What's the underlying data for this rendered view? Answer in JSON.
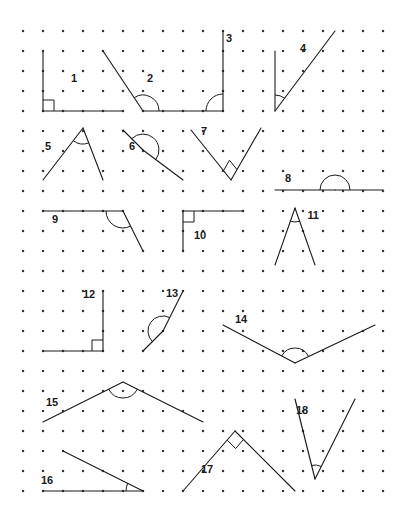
{
  "worksheet": {
    "title": "Angle Identification Dot-Grid Worksheet",
    "width": 395,
    "height": 520,
    "background_color": "#ffffff",
    "stroke_color": "#1a1a1a",
    "dot_color": "#3a3a3a"
  },
  "grid": {
    "type": "dot-lattice",
    "origin_x": 23,
    "origin_y": 31,
    "spacing": 20,
    "columns": 19,
    "rows": 24,
    "dot_radius": 1.1
  },
  "figures": [
    {
      "id": 1,
      "label": "1",
      "label_x": 74,
      "label_y": 78,
      "vertex": [
        43,
        111
      ],
      "rays": [
        [
          43,
          51
        ],
        [
          123,
          111
        ]
      ],
      "marker": "square",
      "marker_size": 11,
      "angle_degrees": 90,
      "classification": "right"
    },
    {
      "id": 2,
      "label": "2",
      "label_x": 150,
      "label_y": 78,
      "vertex": [
        143,
        111
      ],
      "rays": [
        [
          103,
          51
        ],
        [
          203,
          111
        ]
      ],
      "marker": "arc",
      "marker_radius": 16,
      "angle_degrees": 112,
      "classification": "obtuse"
    },
    {
      "id": 3,
      "label": "3",
      "label_x": 229,
      "label_y": 38,
      "vertex": [
        223,
        111
      ],
      "rays": [
        [
          223,
          31
        ],
        [
          203,
          111
        ]
      ],
      "marker": "arc",
      "marker_radius": 17,
      "angle_degrees": 180,
      "classification": "straight"
    },
    {
      "id": 4,
      "label": "4",
      "label_x": 303,
      "label_y": 48,
      "vertex": [
        275,
        111
      ],
      "rays": [
        [
          275,
          51
        ],
        [
          335,
          31
        ]
      ],
      "marker": "arc",
      "marker_radius": 16,
      "angle_degrees": 37,
      "classification": "acute"
    },
    {
      "id": 5,
      "label": "5",
      "label_x": 48,
      "label_y": 146,
      "vertex": [
        83,
        128
      ],
      "rays": [
        [
          43,
          180
        ],
        [
          103,
          180
        ]
      ],
      "marker": "arc",
      "marker_radius": 16,
      "angle_degrees": 38,
      "classification": "acute"
    },
    {
      "id": 6,
      "label": "6",
      "label_x": 132,
      "label_y": 146,
      "vertex": [
        143,
        150
      ],
      "rays": [
        [
          123,
          130
        ],
        [
          183,
          180
        ]
      ],
      "marker": "arc",
      "marker_radius": 16,
      "angle_degrees": 140,
      "classification": "obtuse"
    },
    {
      "id": 7,
      "label": "7",
      "label_x": 204,
      "label_y": 131,
      "vertex": [
        231,
        180
      ],
      "rays": [
        [
          191,
          130
        ],
        [
          261,
          128
        ]
      ],
      "marker": "square",
      "marker_size": 12,
      "angle_degrees": 90,
      "classification": "right"
    },
    {
      "id": 8,
      "label": "8",
      "label_x": 288,
      "label_y": 178,
      "vertex": [
        335,
        190
      ],
      "rays": [
        [
          275,
          190
        ],
        [
          383,
          190
        ]
      ],
      "marker": "arc",
      "marker_radius": 15,
      "angle_degrees": 180,
      "classification": "straight"
    },
    {
      "id": 9,
      "label": "9",
      "label_x": 55,
      "label_y": 219,
      "vertex": [
        123,
        211
      ],
      "rays": [
        [
          43,
          211
        ],
        [
          143,
          251
        ]
      ],
      "marker": "arc",
      "marker_radius": 17,
      "angle_degrees": 117,
      "classification": "obtuse"
    },
    {
      "id": 10,
      "label": "10",
      "label_x": 200,
      "label_y": 235,
      "vertex": [
        183,
        211
      ],
      "rays": [
        [
          183,
          251
        ],
        [
          243,
          211
        ]
      ],
      "marker": "square",
      "marker_size": 11,
      "angle_degrees": 90,
      "classification": "right"
    },
    {
      "id": 11,
      "label": "11",
      "label_x": 313,
      "label_y": 215,
      "vertex": [
        295,
        208
      ],
      "rays": [
        [
          275,
          265
        ],
        [
          315,
          265
        ]
      ],
      "marker": "arc",
      "marker_radius": 14,
      "angle_degrees": 19,
      "classification": "acute"
    },
    {
      "id": 12,
      "label": "12",
      "label_x": 89,
      "label_y": 294,
      "vertex": [
        103,
        351
      ],
      "rays": [
        [
          103,
          291
        ],
        [
          43,
          351
        ]
      ],
      "marker": "square",
      "marker_size": 11,
      "angle_degrees": 90,
      "classification": "right"
    },
    {
      "id": 13,
      "label": "13",
      "label_x": 172,
      "label_y": 293,
      "vertex": [
        163,
        331
      ],
      "rays": [
        [
          183,
          291
        ],
        [
          143,
          351
        ]
      ],
      "marker": "arc",
      "marker_radius": 15,
      "angle_degrees": 180,
      "classification": "straight"
    },
    {
      "id": 14,
      "label": "14",
      "label_x": 241,
      "label_y": 319,
      "vertex": [
        295,
        363
      ],
      "rays": [
        [
          223,
          325
        ],
        [
          375,
          325
        ]
      ],
      "marker": "arc",
      "marker_radius": 15,
      "angle_degrees": 137,
      "classification": "obtuse"
    },
    {
      "id": 15,
      "label": "15",
      "label_x": 52,
      "label_y": 402,
      "vertex": [
        123,
        382
      ],
      "rays": [
        [
          43,
          422
        ],
        [
          203,
          422
        ]
      ],
      "marker": "arc",
      "marker_radius": 16,
      "angle_degrees": 127,
      "classification": "obtuse"
    },
    {
      "id": 16,
      "label": "16",
      "label_x": 47,
      "label_y": 480,
      "vertex": [
        143,
        491
      ],
      "rays": [
        [
          43,
          491
        ],
        [
          63,
          451
        ]
      ],
      "marker": "arc",
      "marker_radius": 17,
      "angle_degrees": 22,
      "classification": "acute"
    },
    {
      "id": 17,
      "label": "17",
      "label_x": 207,
      "label_y": 469,
      "vertex": [
        235,
        431
      ],
      "rays": [
        [
          183,
          491
        ],
        [
          295,
          491
        ]
      ],
      "marker": "square",
      "marker_size": 12,
      "angle_degrees": 90,
      "classification": "right"
    },
    {
      "id": 18,
      "label": "18",
      "label_x": 302,
      "label_y": 410,
      "vertex": [
        315,
        479
      ],
      "rays": [
        [
          295,
          399
        ],
        [
          355,
          399
        ]
      ],
      "marker": "arc",
      "marker_radius": 14,
      "angle_degrees": 27,
      "classification": "acute"
    }
  ]
}
